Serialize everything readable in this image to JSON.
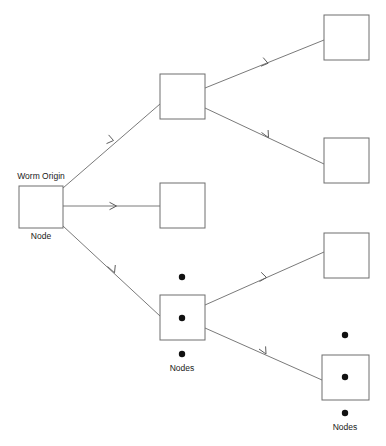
{
  "diagram": {
    "background_color": "#ffffff",
    "box_stroke_color": "#6e6e6e",
    "edge_color": "#7a7a7a",
    "dot_color": "#111111",
    "labels": {
      "worm_origin": "Worm Origin",
      "root_node": "Node",
      "middle_nodes": "Nodes",
      "bottom_nodes": "Nodes"
    },
    "nodes": [
      {
        "id": "root",
        "label_above": "Worm Origin",
        "label_below": "Node",
        "x": 19,
        "y": 186,
        "w": 44,
        "h": 42,
        "has_ellipsis": false
      },
      {
        "id": "child-top",
        "label_above": "",
        "label_below": "",
        "x": 160,
        "y": 74,
        "w": 45,
        "h": 45,
        "has_ellipsis": false
      },
      {
        "id": "child-middle",
        "label_above": "",
        "label_below": "",
        "x": 160,
        "y": 183,
        "w": 45,
        "h": 45,
        "has_ellipsis": false
      },
      {
        "id": "child-bottom-group",
        "label_above": "",
        "label_below": "Nodes",
        "x": 160,
        "y": 295,
        "w": 45,
        "h": 45,
        "has_ellipsis": true
      },
      {
        "id": "leaf-top",
        "label_above": "",
        "label_below": "",
        "x": 324,
        "y": 15,
        "w": 45,
        "h": 45,
        "has_ellipsis": false
      },
      {
        "id": "leaf-second",
        "label_above": "",
        "label_below": "",
        "x": 324,
        "y": 138,
        "w": 45,
        "h": 45,
        "has_ellipsis": false
      },
      {
        "id": "leaf-third",
        "label_above": "",
        "label_below": "",
        "x": 324,
        "y": 233,
        "w": 45,
        "h": 45,
        "has_ellipsis": false
      },
      {
        "id": "leaf-bottom-group",
        "label_above": "",
        "label_below": "Nodes",
        "x": 322,
        "y": 355,
        "w": 47,
        "h": 45,
        "has_ellipsis": true
      }
    ],
    "edges": [
      {
        "id": "root-to-child-top",
        "from": "root",
        "to": "child-top",
        "x1": 63,
        "y1": 188,
        "x2": 160,
        "y2": 104,
        "arrow_t": 0.5
      },
      {
        "id": "root-to-child-middle",
        "from": "root",
        "to": "child-middle",
        "x1": 63,
        "y1": 206,
        "x2": 160,
        "y2": 206,
        "arrow_t": 0.54
      },
      {
        "id": "root-to-child-bottom",
        "from": "root",
        "to": "child-bottom-group",
        "x1": 63,
        "y1": 226,
        "x2": 160,
        "y2": 316,
        "arrow_t": 0.52
      },
      {
        "id": "child-top-to-leaf-top",
        "from": "child-top",
        "to": "leaf-top",
        "x1": 205,
        "y1": 88,
        "x2": 324,
        "y2": 40,
        "arrow_t": 0.52
      },
      {
        "id": "child-top-to-leaf-second",
        "from": "child-top",
        "to": "leaf-second",
        "x1": 205,
        "y1": 108,
        "x2": 324,
        "y2": 164,
        "arrow_t": 0.52
      },
      {
        "id": "child-bottom-to-leaf-third",
        "from": "child-bottom-group",
        "to": "leaf-third",
        "x1": 205,
        "y1": 305,
        "x2": 324,
        "y2": 252,
        "arrow_t": 0.52
      },
      {
        "id": "child-bottom-to-leaf-bottom",
        "from": "child-bottom-group",
        "to": "leaf-bottom-group",
        "x1": 205,
        "y1": 328,
        "x2": 322,
        "y2": 380,
        "arrow_t": 0.52
      }
    ],
    "ellipsis_groups": [
      {
        "id": "middle-ellipsis",
        "cx": 182,
        "dots_y": [
          277,
          318,
          354
        ],
        "label": "Nodes",
        "label_y": 368
      },
      {
        "id": "bottom-ellipsis",
        "cx": 345,
        "dots_y": [
          335,
          377,
          413
        ],
        "label": "Nodes",
        "label_y": 427
      }
    ]
  }
}
